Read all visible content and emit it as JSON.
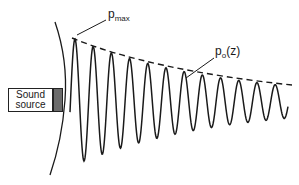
{
  "diagram": {
    "labels": {
      "pmax_main": "p",
      "pmax_sub": "max",
      "po_main": "p",
      "po_sub": "o",
      "po_arg": "(z)",
      "source_line1": "Sound",
      "source_line2": "source"
    },
    "colors": {
      "stroke": "#1a1a1a",
      "emitter": "#6b6b6b",
      "background": "#ffffff"
    },
    "wave": {
      "description": "damped sinusoidal pressure wave emanating from sound source",
      "envelope": "dashed decaying curve p_o(z)"
    }
  }
}
